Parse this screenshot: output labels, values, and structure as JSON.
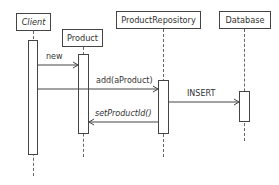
{
  "diagram": {
    "type": "sequence",
    "participants": [
      {
        "name": "Client"
      },
      {
        "name": "Product"
      },
      {
        "name": "ProductRepository"
      },
      {
        "name": "Database"
      }
    ],
    "messages": [
      {
        "label": "new",
        "from": "Client",
        "to": "Product"
      },
      {
        "label": "add(aProduct)",
        "from": "Client",
        "to": "ProductRepository"
      },
      {
        "label": "INSERT",
        "from": "ProductRepository",
        "to": "Database"
      },
      {
        "label": "setProductId()",
        "from": "ProductRepository",
        "to": "Product"
      }
    ],
    "colors": {
      "stroke": "#444444",
      "background": "#ffffff",
      "text": "#333333"
    }
  }
}
